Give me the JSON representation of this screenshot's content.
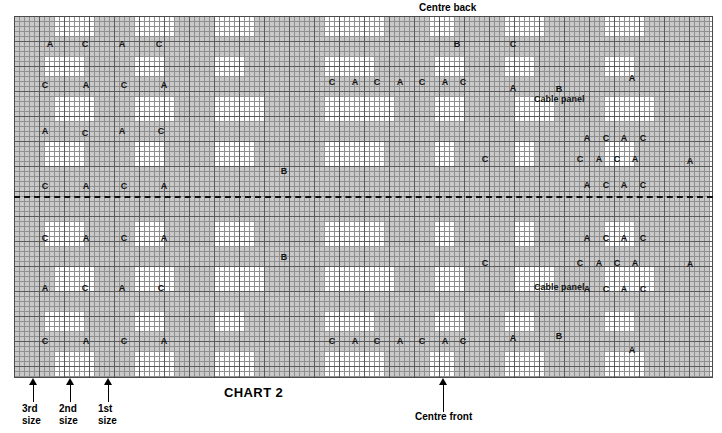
{
  "chart": {
    "title": "CHART 2",
    "type": "knitting-stitch-chart",
    "grid": {
      "columns": 139,
      "rows": 72,
      "cell_px": 5,
      "heavy_every": 5,
      "fine_line_color": "#8f8f8f",
      "heavy_line_color": "#5a5a5a",
      "shade_color": "#c9c9c9",
      "background_color": "#ffffff"
    },
    "midline": {
      "style": "dashed",
      "color": "#111111",
      "row": 36
    }
  },
  "annotations": {
    "centre_back": "Centre back",
    "centre_front": "Centre front",
    "cable_panel": "Cable\npanel",
    "size_markers": [
      {
        "label": "3rd\nsize"
      },
      {
        "label": "2nd\nsize"
      },
      {
        "label": "1st\nsize"
      }
    ]
  },
  "chart_data": {
    "type": "heatmap",
    "title": "CHART 2",
    "xlabel": "",
    "ylabel": "",
    "legend": [
      "A",
      "B",
      "C"
    ],
    "shaded_blocks": [
      [
        0,
        0,
        8,
        4
      ],
      [
        16,
        0,
        8,
        4
      ],
      [
        32,
        0,
        8,
        4
      ],
      [
        48,
        0,
        14,
        4
      ],
      [
        74,
        0,
        9,
        4
      ],
      [
        88,
        0,
        10,
        4
      ],
      [
        106,
        0,
        12,
        4
      ],
      [
        126,
        0,
        13,
        4
      ],
      [
        0,
        4,
        139,
        4
      ],
      [
        0,
        8,
        6,
        4
      ],
      [
        14,
        8,
        10,
        4
      ],
      [
        30,
        8,
        10,
        4
      ],
      [
        46,
        8,
        16,
        4
      ],
      [
        72,
        8,
        12,
        4
      ],
      [
        90,
        8,
        8,
        4
      ],
      [
        104,
        8,
        14,
        4
      ],
      [
        124,
        8,
        15,
        4
      ],
      [
        0,
        12,
        139,
        4
      ],
      [
        0,
        16,
        8,
        5
      ],
      [
        16,
        16,
        8,
        5
      ],
      [
        32,
        16,
        8,
        5
      ],
      [
        50,
        16,
        12,
        5
      ],
      [
        76,
        16,
        8,
        5
      ],
      [
        90,
        16,
        10,
        5
      ],
      [
        108,
        16,
        10,
        5
      ],
      [
        128,
        16,
        11,
        5
      ],
      [
        0,
        21,
        139,
        4
      ],
      [
        0,
        25,
        6,
        5
      ],
      [
        14,
        25,
        10,
        5
      ],
      [
        30,
        25,
        10,
        5
      ],
      [
        48,
        25,
        14,
        5
      ],
      [
        74,
        25,
        10,
        5
      ],
      [
        88,
        25,
        12,
        5
      ],
      [
        104,
        25,
        14,
        5
      ],
      [
        124,
        25,
        15,
        5
      ],
      [
        0,
        30,
        139,
        6
      ],
      [
        0,
        36,
        139,
        5
      ],
      [
        0,
        41,
        6,
        5
      ],
      [
        14,
        41,
        10,
        5
      ],
      [
        30,
        41,
        10,
        5
      ],
      [
        48,
        41,
        14,
        5
      ],
      [
        74,
        41,
        10,
        5
      ],
      [
        88,
        41,
        12,
        5
      ],
      [
        104,
        41,
        14,
        5
      ],
      [
        124,
        41,
        15,
        5
      ],
      [
        0,
        46,
        139,
        4
      ],
      [
        0,
        50,
        8,
        5
      ],
      [
        16,
        50,
        8,
        5
      ],
      [
        32,
        50,
        8,
        5
      ],
      [
        50,
        50,
        12,
        5
      ],
      [
        76,
        50,
        8,
        5
      ],
      [
        90,
        50,
        10,
        5
      ],
      [
        108,
        50,
        10,
        5
      ],
      [
        128,
        50,
        11,
        5
      ],
      [
        0,
        55,
        139,
        4
      ],
      [
        0,
        59,
        6,
        4
      ],
      [
        14,
        59,
        10,
        4
      ],
      [
        30,
        59,
        10,
        4
      ],
      [
        46,
        59,
        16,
        4
      ],
      [
        72,
        59,
        12,
        4
      ],
      [
        90,
        59,
        8,
        4
      ],
      [
        104,
        59,
        14,
        4
      ],
      [
        124,
        59,
        15,
        4
      ],
      [
        0,
        63,
        139,
        4
      ],
      [
        0,
        67,
        8,
        5
      ],
      [
        16,
        67,
        8,
        5
      ],
      [
        32,
        67,
        8,
        5
      ],
      [
        48,
        67,
        14,
        5
      ],
      [
        74,
        67,
        9,
        5
      ],
      [
        88,
        67,
        10,
        5
      ],
      [
        106,
        67,
        12,
        5
      ],
      [
        126,
        67,
        13,
        5
      ]
    ],
    "symbols": [
      {
        "t": "A",
        "x": 36,
        "y": 28
      },
      {
        "t": "C",
        "x": 71,
        "y": 28
      },
      {
        "t": "A",
        "x": 108,
        "y": 28
      },
      {
        "t": "C",
        "x": 145,
        "y": 28
      },
      {
        "t": "B",
        "x": 443,
        "y": 28
      },
      {
        "t": "C",
        "x": 499,
        "y": 28
      },
      {
        "t": "C",
        "x": 31,
        "y": 69
      },
      {
        "t": "A",
        "x": 72,
        "y": 69
      },
      {
        "t": "C",
        "x": 110,
        "y": 69
      },
      {
        "t": "A",
        "x": 150,
        "y": 69
      },
      {
        "t": "C",
        "x": 318,
        "y": 66
      },
      {
        "t": "A",
        "x": 341,
        "y": 66
      },
      {
        "t": "C",
        "x": 363,
        "y": 66
      },
      {
        "t": "A",
        "x": 386,
        "y": 66
      },
      {
        "t": "C",
        "x": 408,
        "y": 66
      },
      {
        "t": "A",
        "x": 431,
        "y": 66
      },
      {
        "t": "C",
        "x": 449,
        "y": 66
      },
      {
        "t": "A",
        "x": 499,
        "y": 72
      },
      {
        "t": "B",
        "x": 545,
        "y": 73
      },
      {
        "t": "A",
        "x": 618,
        "y": 62
      },
      {
        "t": "A",
        "x": 31,
        "y": 115
      },
      {
        "t": "C",
        "x": 71,
        "y": 117
      },
      {
        "t": "A",
        "x": 108,
        "y": 115
      },
      {
        "t": "C",
        "x": 147,
        "y": 115
      },
      {
        "t": "A",
        "x": 573,
        "y": 122
      },
      {
        "t": "C",
        "x": 592,
        "y": 122
      },
      {
        "t": "A",
        "x": 610,
        "y": 122
      },
      {
        "t": "C",
        "x": 629,
        "y": 122
      },
      {
        "t": "B",
        "x": 270,
        "y": 155
      },
      {
        "t": "C",
        "x": 471,
        "y": 143
      },
      {
        "t": "C",
        "x": 566,
        "y": 143
      },
      {
        "t": "A",
        "x": 585,
        "y": 143
      },
      {
        "t": "C",
        "x": 603,
        "y": 143
      },
      {
        "t": "A",
        "x": 621,
        "y": 143
      },
      {
        "t": "A",
        "x": 676,
        "y": 145
      },
      {
        "t": "C",
        "x": 31,
        "y": 170
      },
      {
        "t": "A",
        "x": 72,
        "y": 170
      },
      {
        "t": "C",
        "x": 110,
        "y": 170
      },
      {
        "t": "A",
        "x": 150,
        "y": 170
      },
      {
        "t": "A",
        "x": 573,
        "y": 169
      },
      {
        "t": "C",
        "x": 592,
        "y": 169
      },
      {
        "t": "A",
        "x": 610,
        "y": 169
      },
      {
        "t": "C",
        "x": 629,
        "y": 169
      },
      {
        "t": "C",
        "x": 31,
        "y": 222
      },
      {
        "t": "A",
        "x": 72,
        "y": 222
      },
      {
        "t": "C",
        "x": 110,
        "y": 222
      },
      {
        "t": "A",
        "x": 150,
        "y": 222
      },
      {
        "t": "A",
        "x": 573,
        "y": 222
      },
      {
        "t": "C",
        "x": 592,
        "y": 222
      },
      {
        "t": "A",
        "x": 610,
        "y": 222
      },
      {
        "t": "C",
        "x": 629,
        "y": 222
      },
      {
        "t": "B",
        "x": 270,
        "y": 241
      },
      {
        "t": "C",
        "x": 471,
        "y": 247
      },
      {
        "t": "C",
        "x": 566,
        "y": 247
      },
      {
        "t": "A",
        "x": 585,
        "y": 247
      },
      {
        "t": "C",
        "x": 603,
        "y": 247
      },
      {
        "t": "A",
        "x": 621,
        "y": 247
      },
      {
        "t": "A",
        "x": 676,
        "y": 248
      },
      {
        "t": "A",
        "x": 31,
        "y": 272
      },
      {
        "t": "C",
        "x": 71,
        "y": 272
      },
      {
        "t": "A",
        "x": 108,
        "y": 272
      },
      {
        "t": "C",
        "x": 147,
        "y": 272
      },
      {
        "t": "A",
        "x": 573,
        "y": 273
      },
      {
        "t": "C",
        "x": 592,
        "y": 273
      },
      {
        "t": "A",
        "x": 610,
        "y": 273
      },
      {
        "t": "C",
        "x": 629,
        "y": 273
      },
      {
        "t": "C",
        "x": 31,
        "y": 325
      },
      {
        "t": "A",
        "x": 72,
        "y": 325
      },
      {
        "t": "C",
        "x": 110,
        "y": 325
      },
      {
        "t": "A",
        "x": 150,
        "y": 325
      },
      {
        "t": "C",
        "x": 318,
        "y": 325
      },
      {
        "t": "A",
        "x": 341,
        "y": 325
      },
      {
        "t": "C",
        "x": 363,
        "y": 325
      },
      {
        "t": "A",
        "x": 386,
        "y": 325
      },
      {
        "t": "C",
        "x": 408,
        "y": 325
      },
      {
        "t": "A",
        "x": 431,
        "y": 325
      },
      {
        "t": "C",
        "x": 449,
        "y": 325
      },
      {
        "t": "A",
        "x": 499,
        "y": 322
      },
      {
        "t": "B",
        "x": 545,
        "y": 320
      },
      {
        "t": "A",
        "x": 618,
        "y": 334
      },
      {
        "t": "A",
        "x": 36,
        "y": 367
      },
      {
        "t": "C",
        "x": 71,
        "y": 367
      },
      {
        "t": "A",
        "x": 108,
        "y": 367
      },
      {
        "t": "C",
        "x": 145,
        "y": 367
      },
      {
        "t": "B",
        "x": 443,
        "y": 367
      },
      {
        "t": "C",
        "x": 499,
        "y": 367
      }
    ]
  }
}
